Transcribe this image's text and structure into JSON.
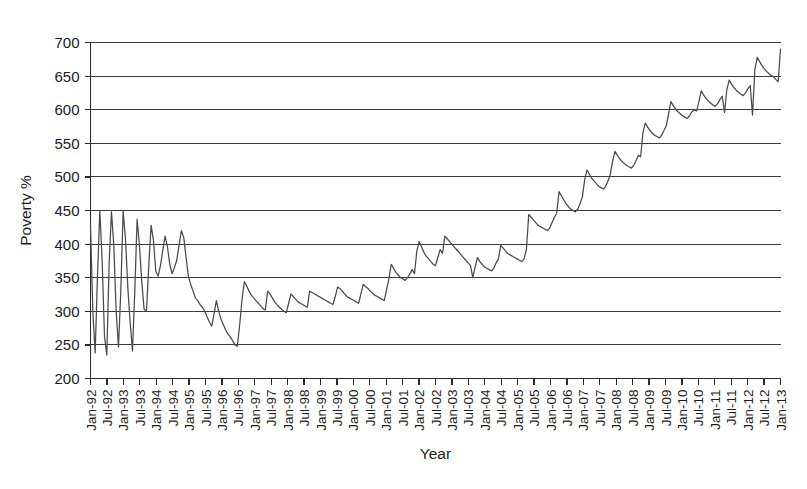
{
  "chart_data": {
    "type": "line",
    "title": "",
    "xlabel": "Year",
    "ylabel": "Poverty %",
    "ylim": [
      200,
      700
    ],
    "yticks": [
      200,
      250,
      300,
      350,
      400,
      450,
      500,
      550,
      600,
      650,
      700
    ],
    "grid": true,
    "legend": false,
    "legend_position": "none",
    "xtick_labels": [
      "Jan-92",
      "Jul-92",
      "Jan-93",
      "Jul-93",
      "Jan-94",
      "Jul-94",
      "Jan-95",
      "Jul-95",
      "Jan-96",
      "Jul-96",
      "Jan-97",
      "Jul-97",
      "Jan-98",
      "Jul-98",
      "Jan-99",
      "Jul-99",
      "Jan-00",
      "Jul-00",
      "Jan-01",
      "Jul-01",
      "Jan-02",
      "Jul-02",
      "Jan-03",
      "Jul-03",
      "Jan-04",
      "Jul-04",
      "Jan-05",
      "Jul-05",
      "Jan-06",
      "Jul-06",
      "Jan-07",
      "Jul-07",
      "Jan-08",
      "Jul-08",
      "Jan-09",
      "Jul-09",
      "Jan-10",
      "Jul-10",
      "Jan-11",
      "Jul-11",
      "Jan-12",
      "Jul-12",
      "Jan-13"
    ],
    "series": [
      {
        "name": "Poverty %",
        "x_start": "Jan-92",
        "x_step_months": 1,
        "values": [
          428,
          300,
          238,
          352,
          450,
          375,
          262,
          235,
          372,
          448,
          398,
          300,
          247,
          330,
          449,
          408,
          336,
          284,
          241,
          330,
          437,
          398,
          344,
          303,
          300,
          368,
          428,
          406,
          360,
          352,
          368,
          390,
          412,
          396,
          370,
          356,
          365,
          376,
          398,
          420,
          410,
          380,
          352,
          340,
          330,
          320,
          316,
          310,
          306,
          300,
          292,
          284,
          278,
          296,
          316,
          300,
          288,
          280,
          272,
          266,
          262,
          256,
          250,
          248,
          280,
          318,
          344,
          338,
          330,
          324,
          320,
          316,
          312,
          308,
          304,
          302,
          330,
          326,
          320,
          314,
          310,
          306,
          303,
          300,
          298,
          312,
          326,
          322,
          318,
          314,
          312,
          310,
          308,
          306,
          330,
          328,
          326,
          324,
          322,
          320,
          318,
          316,
          314,
          312,
          310,
          322,
          336,
          334,
          330,
          326,
          322,
          320,
          318,
          316,
          314,
          312,
          326,
          340,
          337,
          334,
          330,
          327,
          324,
          322,
          320,
          318,
          316,
          332,
          348,
          370,
          364,
          358,
          354,
          350,
          348,
          346,
          350,
          356,
          362,
          356,
          390,
          404,
          396,
          388,
          382,
          378,
          374,
          370,
          368,
          380,
          392,
          386,
          412,
          408,
          404,
          400,
          396,
          392,
          388,
          384,
          380,
          376,
          372,
          368,
          350,
          366,
          380,
          374,
          370,
          366,
          364,
          362,
          360,
          364,
          372,
          378,
          398,
          394,
          390,
          386,
          384,
          382,
          380,
          378,
          376,
          374,
          378,
          392,
          444,
          440,
          436,
          432,
          428,
          426,
          424,
          422,
          420,
          424,
          432,
          440,
          446,
          478,
          472,
          466,
          460,
          456,
          452,
          450,
          448,
          452,
          460,
          470,
          496,
          510,
          504,
          498,
          494,
          490,
          486,
          484,
          482,
          486,
          494,
          504,
          524,
          538,
          532,
          527,
          523,
          520,
          517,
          515,
          513,
          517,
          524,
          532,
          530,
          566,
          580,
          574,
          569,
          565,
          562,
          560,
          558,
          562,
          569,
          576,
          594,
          612,
          606,
          601,
          597,
          594,
          591,
          589,
          587,
          591,
          597,
          600,
          598,
          612,
          628,
          622,
          617,
          613,
          610,
          607,
          605,
          609,
          615,
          620,
          596,
          630,
          644,
          638,
          633,
          629,
          626,
          623,
          621,
          625,
          631,
          636,
          592,
          660,
          678,
          672,
          666,
          661,
          657,
          654,
          651,
          649,
          645,
          642,
          690
        ],
        "y_first": 428,
        "y_last": 690,
        "y_min": 235,
        "y_max": 690
      }
    ]
  },
  "axes": {
    "y_title": "Poverty %",
    "x_title": "Year"
  }
}
